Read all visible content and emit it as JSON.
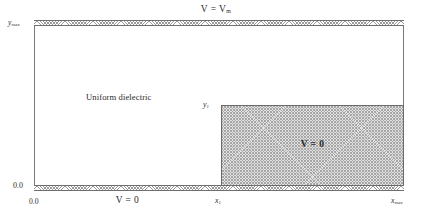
{
  "figure": {
    "type": "boundary-value-domain-diagram",
    "background_color": "#ffffff",
    "line_color": "#6e6e6e",
    "shade_color": "#e2e2e2"
  },
  "boundaries": {
    "top_potential": "V = V",
    "top_potential_subscript": "m",
    "bottom_potential": "V = 0",
    "conductor_potential": "V = 0"
  },
  "regions": {
    "dielectric_label": "Uniform dielectric",
    "conductor_label": "V = 0"
  },
  "axes": {
    "y_max": "y",
    "y_max_subscript": "max",
    "y_origin": "0.0",
    "y_step": "y",
    "y_step_subscript": "1",
    "x_origin": "0.0",
    "x_step": "x",
    "x_step_subscript": "1",
    "x_max": "x",
    "x_max_subscript": "max"
  },
  "geometry": {
    "domain_left": "0.0",
    "domain_right": "x_max",
    "domain_bottom": "0.0",
    "domain_top": "y_max",
    "block_left": "x_1",
    "block_right": "x_max",
    "block_bottom": "0.0",
    "block_top": "y_1"
  }
}
